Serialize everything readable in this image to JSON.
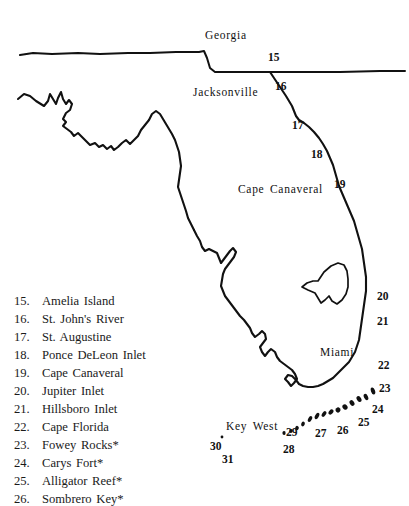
{
  "figure": {
    "type": "map",
    "region": "Florida",
    "background_color": "#ffffff",
    "ink_color": "#111111"
  },
  "map_labels": [
    {
      "name": "georgia",
      "text": "Georgia",
      "x": 205,
      "y": 29
    },
    {
      "name": "jacksonville",
      "text": "Jacksonville",
      "x": 193,
      "y": 86
    },
    {
      "name": "cape-canaveral",
      "text": "Cape Canaveral",
      "x": 238,
      "y": 183
    },
    {
      "name": "miami",
      "text": "Miami",
      "x": 320,
      "y": 346
    },
    {
      "name": "key-west",
      "text": "Key West",
      "x": 226,
      "y": 420
    }
  ],
  "map_numbers": [
    {
      "name": "15",
      "text": "15",
      "x": 268,
      "y": 51
    },
    {
      "name": "16",
      "text": "16",
      "x": 275,
      "y": 80
    },
    {
      "name": "17",
      "text": "17",
      "x": 292,
      "y": 119
    },
    {
      "name": "18",
      "text": "18",
      "x": 311,
      "y": 148
    },
    {
      "name": "19",
      "text": "19",
      "x": 334,
      "y": 178
    },
    {
      "name": "20",
      "text": "20",
      "x": 377,
      "y": 290
    },
    {
      "name": "21",
      "text": "21",
      "x": 377,
      "y": 315
    },
    {
      "name": "22",
      "text": "22",
      "x": 378,
      "y": 359
    },
    {
      "name": "23",
      "text": "23",
      "x": 379,
      "y": 382
    },
    {
      "name": "24",
      "text": "24",
      "x": 372,
      "y": 403
    },
    {
      "name": "25",
      "text": "25",
      "x": 358,
      "y": 416
    },
    {
      "name": "26",
      "text": "26",
      "x": 337,
      "y": 424
    },
    {
      "name": "27",
      "text": "27",
      "x": 315,
      "y": 427
    },
    {
      "name": "28",
      "text": "28",
      "x": 283,
      "y": 443
    },
    {
      "name": "29",
      "text": "29",
      "x": 286,
      "y": 426
    },
    {
      "name": "30",
      "text": "30",
      "x": 210,
      "y": 440
    },
    {
      "name": "31",
      "text": "31",
      "x": 222,
      "y": 453
    }
  ],
  "legend": {
    "items": [
      {
        "num": "15.",
        "label": "Amelia Island"
      },
      {
        "num": "16.",
        "label": "St. John's River"
      },
      {
        "num": "17.",
        "label": "St. Augustine"
      },
      {
        "num": "18.",
        "label": "Ponce DeLeon Inlet"
      },
      {
        "num": "19.",
        "label": "Cape Canaveral"
      },
      {
        "num": "20.",
        "label": "Jupiter Inlet"
      },
      {
        "num": "21.",
        "label": "Hillsboro Inlet"
      },
      {
        "num": "22.",
        "label": "Cape Florida"
      },
      {
        "num": "23.",
        "label": "Fowey Rocks*"
      },
      {
        "num": "24.",
        "label": "Carys Fort*"
      },
      {
        "num": "25.",
        "label": "Alligator Reef*"
      },
      {
        "num": "26.",
        "label": "Sombrero Key*"
      }
    ]
  },
  "geometry": {
    "north_border": "M 20,55 L 33,53 L 52,54 L 78,53 L 100,54 L 128,53 L 150,53 L 176,52 L 199,52 L 204,51 L 207,58 L 210,68 L 215,72 L 242,72 L 270,72 L 300,72 L 340,72 L 380,71 L 405,71",
    "gulf_coast_panhandle": "M 18,99 L 24,94 L 30,96 L 36,101 L 44,106 L 48,101 L 50,94 L 53,99 L 56,104 L 58,98 L 61,92 L 63,99 L 66,104 L 69,100 L 72,104 L 70,110 L 66,113 L 63,119 L 66,122 L 63,126 L 67,129 L 71,132 L 74,136 L 78,133 L 82,137 L 86,141 L 90,145 L 95,143 L 99,147 L 103,145 L 107,149 L 111,146 L 114,150 L 118,147 L 122,143 L 126,140 L 130,144 L 134,140 L 138,136 L 141,130 L 145,125 L 149,120 L 152,114 L 156,111 L 160,114 L 163,119 L 166,124 L 169,129 L 172,134 L 175,140 L 177,146 L 179,152 L 180,159 L 181,166 L 180,173 L 179,180 L 178,187 L 180,193 L 182,199 L 184,205 L 186,211 L 188,218 L 191,224 L 194,230",
    "west_coast": "M 194,230 L 197,236 L 200,241 L 202,247 L 205,251 L 209,249 L 213,251 L 217,253 L 219,258 L 221,263 L 224,259 L 227,255 L 230,251 L 233,248 L 236,252 L 234,257 L 231,261 L 228,265 L 225,269 L 223,274 L 222,280 L 221,286 L 223,291 L 225,296 L 228,300 L 231,304 L 234,308 L 237,312 L 240,316 L 244,320 L 247,324 L 250,328 L 252,333 L 255,337 L 259,334 L 262,331 L 265,334 L 266,339 L 263,343 L 260,347 L 262,352 L 265,356 L 268,352 L 271,349 L 275,352 L 277,357 L 280,361 L 284,364 L 288,367 L 292,370 L 295,374 L 297,379 L 294,383 L 291,386 L 288,382 L 285,379 L 288,375 L 292,376 L 296,380 L 299,384 L 303,386 L 308,387 L 313,387 L 318,386 L 323,384 L 328,381 L 333,378 L 337,374 L 341,370 L 345,366 L 349,362 L 352,357 L 355,352 L 357,346 L 359,340 L 360,333 L 361,326 L 362,319 L 363,312 L 364,305 L 365,298 L 366,291 L 366,284 L 366,277 L 365,270 L 364,263 L 363,256 L 362,249 L 360,242 L 358,235 L 356,228 L 354,221 L 351,214 L 348,207 L 345,200 L 342,193 L 339,186 L 337,179 L 335,172 L 333,165 L 330,158 L 327,151 L 323,144 L 319,138 L 314,132 L 309,127 L 304,123 L 299,120 L 296,116 L 294,111 L 292,106 L 289,101 L 286,96 L 282,90 L 278,84 L 274,78 L 270,72",
    "lake_okeechobee": "M 318,281 L 324,272 L 331,266 L 338,263 L 344,265 L 347,271 L 348,279 L 348,287 L 346,294 L 342,300 L 337,304 L 332,301 L 329,296 L 325,300 L 321,303 L 318,298 L 315,293 L 308,290 L 302,287 L 307,283 L 313,281 Z",
    "keys": [
      {
        "cx": 373,
        "cy": 391,
        "rx": 2.0,
        "ry": 3.6,
        "rot": -20
      },
      {
        "cx": 366,
        "cy": 397,
        "rx": 2.0,
        "ry": 3.4,
        "rot": -25
      },
      {
        "cx": 359,
        "cy": 399,
        "rx": 2.2,
        "ry": 3.2,
        "rot": -30
      },
      {
        "cx": 352,
        "cy": 403,
        "rx": 2.2,
        "ry": 3.0,
        "rot": -35
      },
      {
        "cx": 345,
        "cy": 407,
        "rx": 2.4,
        "ry": 2.8,
        "rot": -40
      },
      {
        "cx": 338,
        "cy": 410,
        "rx": 2.6,
        "ry": 2.4,
        "rot": -45
      },
      {
        "cx": 331,
        "cy": 412,
        "rx": 3.0,
        "ry": 2.0,
        "rot": -50
      },
      {
        "cx": 324,
        "cy": 414,
        "rx": 3.2,
        "ry": 1.8,
        "rot": -55
      },
      {
        "cx": 317,
        "cy": 416,
        "rx": 3.4,
        "ry": 1.8,
        "rot": -60
      },
      {
        "cx": 310,
        "cy": 419,
        "rx": 3.2,
        "ry": 1.8,
        "rot": -62
      },
      {
        "cx": 303,
        "cy": 424,
        "rx": 2.4,
        "ry": 1.8,
        "rot": -70
      },
      {
        "cx": 297,
        "cy": 428,
        "rx": 2.2,
        "ry": 1.8,
        "rot": -75
      },
      {
        "cx": 291,
        "cy": 431,
        "rx": 2.0,
        "ry": 1.6,
        "rot": -80
      },
      {
        "cx": 284,
        "cy": 433,
        "rx": 2.0,
        "ry": 1.6,
        "rot": -85
      },
      {
        "cx": 222,
        "cy": 437,
        "rx": 1.4,
        "ry": 1.4,
        "rot": 0
      }
    ]
  }
}
